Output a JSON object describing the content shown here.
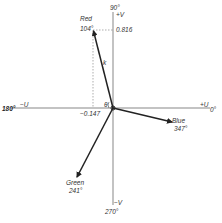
{
  "diagram": {
    "type": "vector-phasor",
    "origin": {
      "x": 113,
      "y": 108
    },
    "axes": {
      "top_angle": "90°",
      "top_label": "+V",
      "bottom_angle": "270°",
      "bottom_label": "−V",
      "left_angle": "180°",
      "left_label": "−U",
      "right_angle": "0°",
      "right_label": "+U"
    },
    "vectors": [
      {
        "name": "Red",
        "angle": "104°",
        "tip": {
          "x": 93,
          "y": 30
        }
      },
      {
        "name": "Blue",
        "angle": "347°",
        "tip": {
          "x": 173,
          "y": 122
        }
      },
      {
        "name": "Green",
        "angle": "241°",
        "tip": {
          "x": 76,
          "y": 178
        }
      }
    ],
    "projections": {
      "v_value": "0.816",
      "u_value": "−0.147"
    },
    "annotations": {
      "magnitude_label": "k",
      "angle_label": "θ"
    },
    "colors": {
      "line": "#222222",
      "axis": "#555555",
      "dashed": "#777777"
    }
  }
}
